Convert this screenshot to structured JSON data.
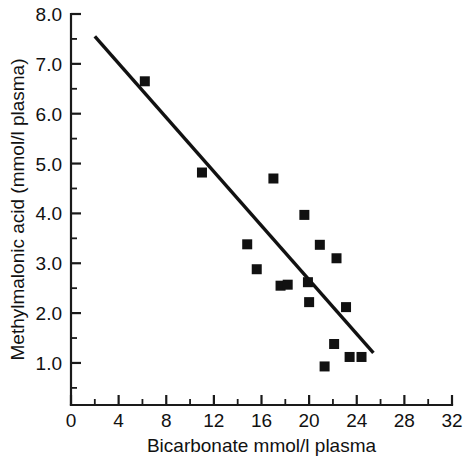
{
  "chart_data": {
    "type": "scatter",
    "title": "",
    "xlabel": "Bicarbonate mmol/l plasma",
    "ylabel": "Methylmalonic acid (mmol/l plasma)",
    "xlim": [
      0,
      32
    ],
    "ylim": [
      0.3,
      8.0
    ],
    "grid": false,
    "legend": null,
    "x_ticks": [
      0,
      4,
      8,
      12,
      16,
      20,
      24,
      28,
      32
    ],
    "x_tick_labels": [
      "0",
      "4",
      "8",
      "12",
      "16",
      "20",
      "24",
      "28",
      "32"
    ],
    "x_minor_ticks": [
      2,
      6,
      10,
      14,
      18,
      22,
      26,
      30
    ],
    "y_ticks": [
      1.0,
      2.0,
      3.0,
      4.0,
      5.0,
      6.0,
      7.0,
      8.0
    ],
    "y_tick_labels": [
      "1.0",
      "2.0",
      "3.0",
      "4.0",
      "5.0",
      "6.0",
      "7.0",
      "8.0"
    ],
    "y_minor_ticks": [
      0.5,
      1.5,
      2.5,
      3.5,
      4.5,
      5.5,
      6.5,
      7.5
    ],
    "marker": "square",
    "marker_color": "#111111",
    "points": [
      {
        "x": 6.2,
        "y": 6.65
      },
      {
        "x": 11.0,
        "y": 4.82
      },
      {
        "x": 14.8,
        "y": 3.38
      },
      {
        "x": 15.6,
        "y": 2.88
      },
      {
        "x": 17.0,
        "y": 4.7
      },
      {
        "x": 17.6,
        "y": 2.55
      },
      {
        "x": 18.2,
        "y": 2.57
      },
      {
        "x": 19.6,
        "y": 3.97
      },
      {
        "x": 19.9,
        "y": 2.62
      },
      {
        "x": 20.0,
        "y": 2.22
      },
      {
        "x": 20.9,
        "y": 3.37
      },
      {
        "x": 21.3,
        "y": 0.93
      },
      {
        "x": 22.1,
        "y": 1.38
      },
      {
        "x": 22.3,
        "y": 3.1
      },
      {
        "x": 23.1,
        "y": 2.12
      },
      {
        "x": 23.4,
        "y": 1.12
      },
      {
        "x": 24.4,
        "y": 1.12
      }
    ],
    "fit_line": {
      "type": "linear_regression",
      "x_start": 2.0,
      "y_start": 7.55,
      "x_end": 25.4,
      "y_end": 1.2
    }
  }
}
